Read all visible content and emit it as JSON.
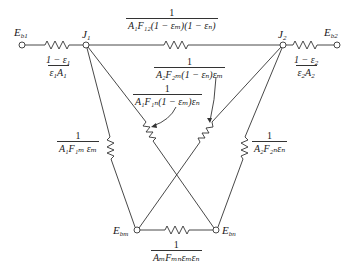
{
  "diagram": {
    "type": "radiation-network",
    "stroke_color": "#333333",
    "nodes": [
      {
        "id": "Eb1",
        "label_main": "E",
        "label_sub": "b1"
      },
      {
        "id": "J1",
        "label_main": "J",
        "label_sub": "1"
      },
      {
        "id": "J2",
        "label_main": "J",
        "label_sub": "2"
      },
      {
        "id": "Eb2",
        "label_main": "E",
        "label_sub": "b2"
      },
      {
        "id": "Ebm",
        "label_main": "E",
        "label_sub": "bm"
      },
      {
        "id": "Ebn",
        "label_main": "E",
        "label_sub": "bn"
      }
    ],
    "resistances": {
      "r_surface1": {
        "num": "1",
        "den": "1 − ε₁ / ε₁A₁",
        "num_text": "1 − ε",
        "num_sub": "1",
        "den_text": "ε",
        "den_sub1": "1",
        "den_text2": "A",
        "den_sub2": "1"
      },
      "r_surface2": {
        "num_text": "1 − ε",
        "num_sub": "2",
        "den_text": "ε",
        "den_sub1": "2",
        "den_text2": "A",
        "den_sub2": "2"
      },
      "r_12": {
        "num": "1",
        "den": "A₁F₁₂(1 − εₘ)(1 − εₙ)"
      },
      "r_2m": {
        "num": "1",
        "den": "A₂F₂ₘ(1 − εₙ)εₘ"
      },
      "r_1n": {
        "num": "1",
        "den": "A₁F₁ₙ(1 − εₘ)εₙ"
      },
      "r_1m": {
        "num": "1",
        "den": "A₁F₁ₘεₘ"
      },
      "r_2n": {
        "num": "1",
        "den": "A₂F₂ₙεₙ"
      },
      "r_mn": {
        "num": "1",
        "den": "AₘFₘₙεₘεₙ"
      }
    },
    "connections": [
      {
        "from": "Eb1",
        "to": "J1",
        "resistance": "r_surface1"
      },
      {
        "from": "J1",
        "to": "J2",
        "resistance": "r_12"
      },
      {
        "from": "J2",
        "to": "Eb2",
        "resistance": "r_surface2"
      },
      {
        "from": "J1",
        "to": "Ebm",
        "resistance": "r_1m"
      },
      {
        "from": "J1",
        "to": "Ebn",
        "resistance": "r_1n"
      },
      {
        "from": "J2",
        "to": "Ebm",
        "resistance": "r_2m"
      },
      {
        "from": "J2",
        "to": "Ebn",
        "resistance": "r_2n"
      },
      {
        "from": "Ebm",
        "to": "Ebn",
        "resistance": "r_mn"
      }
    ]
  },
  "labels": {
    "E": "E",
    "J": "J",
    "one": "1",
    "eb1_sub": "b1",
    "eb2_sub": "b2",
    "ebm_sub": "bm",
    "ebn_sub": "bn",
    "j1_sub": "1",
    "j2_sub": "2",
    "s1_num": "1 − ε",
    "s1_num_sub": "1",
    "s1_den_a": "ε",
    "s1_den_sub": "1",
    "s1_den_b": "A",
    "s1_den_sub2": "1",
    "s2_num": "1 − ε",
    "s2_num_sub": "2",
    "s2_den_a": "ε",
    "s2_den_sub": "2",
    "s2_den_b": "A",
    "s2_den_sub2": "2",
    "r12_den": "A₁F₁₂(1 − εₘ)(1 − εₙ)",
    "r2m_den": "A₂F₂ₘ(1 − εₙ)εₘ",
    "r1n_den": "A₁F₁ₙ(1 − εₘ)εₙ",
    "r1m_den": "A₁F₁ₘ εₘ",
    "r2n_den": "A₂F₂ₙεₙ",
    "rmn_den": "AₘFₘₙεₘεₙ"
  }
}
